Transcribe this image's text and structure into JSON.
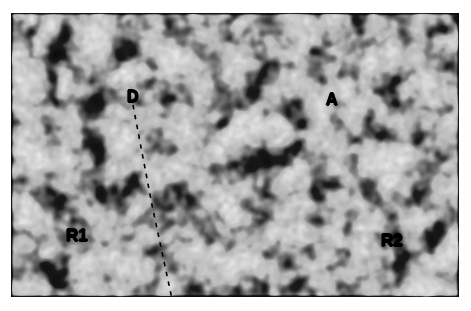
{
  "figure": {
    "type": "stm-micrograph",
    "panel": {
      "x": 11,
      "y": 13,
      "width": 448,
      "height": 284
    },
    "background_color": "#ffffff",
    "image_description": "High-contrast grayscale scanning tunneling microscopy image of a quasicrystalline surface showing bright cluster blobs separated by dark depressions",
    "color_low": "#000000",
    "color_high": "#ffffff"
  },
  "annotations": {
    "domain_label": "D",
    "region_a_label": "A",
    "region_r1_label": "R1",
    "region_r2_label": "R2",
    "boundary": {
      "name": "domain-boundary-dashed-line",
      "style": "dashed",
      "color": "#000000",
      "x1": 133,
      "y1": 105,
      "x2": 152,
      "y2": 205,
      "x3": 172,
      "y3": 299
    }
  },
  "chart_data": {
    "type": "heatmap",
    "title": "",
    "xlabel": "",
    "ylabel": "",
    "colormap": "grayscale",
    "labels": [
      "D",
      "A",
      "R1",
      "R2"
    ],
    "label_positions": [
      {
        "label": "D",
        "x": 133,
        "y": 97
      },
      {
        "label": "A",
        "x": 332,
        "y": 100
      },
      {
        "label": "R1",
        "x": 77,
        "y": 235
      },
      {
        "label": "R2",
        "x": 392,
        "y": 240
      }
    ]
  }
}
